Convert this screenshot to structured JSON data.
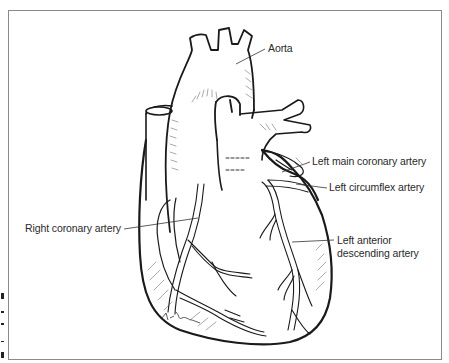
{
  "figure": {
    "labels": {
      "aorta": "Aorta",
      "left_main": "Left main coronary artery",
      "left_circumflex": "Left circumflex artery",
      "right_coronary": "Right coronary artery",
      "lad_line1": "Left anterior",
      "lad_line2": "descending artery"
    },
    "signature": "K.Born",
    "colors": {
      "ink": "#1a1a1a",
      "frame": "#8a8a8a",
      "label": "#2a2a2a",
      "background": "#ffffff"
    }
  }
}
